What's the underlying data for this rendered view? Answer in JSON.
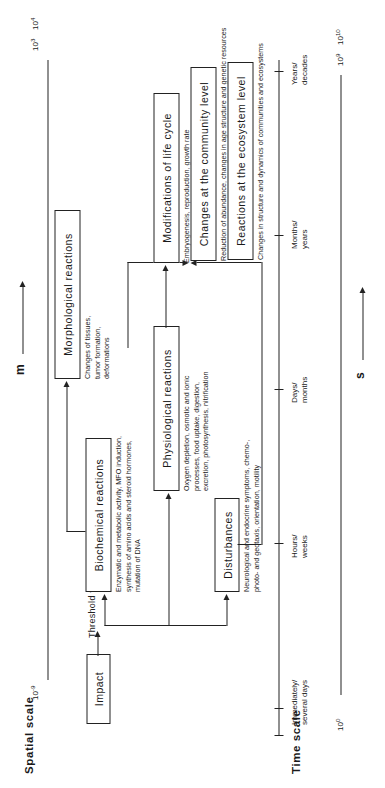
{
  "figure": {
    "spatial_scale_title": "Spatial scale",
    "time_scale_title": "Time scale"
  },
  "spatial_axis": {
    "unit": "m",
    "left_label": "10",
    "left_exp": "-9",
    "right_label_1": "10",
    "right_exp_1": "3",
    "right_label_2": "10",
    "right_exp_2": "4"
  },
  "time_axis": {
    "unit": "s",
    "left_label": "10",
    "left_exp": "0",
    "right_label_1": "10",
    "right_exp_1": "9",
    "right_label_2": "10",
    "right_exp_2": "10",
    "ticks": [
      "Immediately/\nseveral days",
      "Hours/\nweeks",
      "Days/\nmonths",
      "Months/\nyears",
      "Years/\ndecades"
    ]
  },
  "nodes": {
    "impact": {
      "label": "Impact",
      "caption": ""
    },
    "threshold": {
      "label": "Threshold value"
    },
    "biochemical": {
      "label": "Biochemical   reactions",
      "caption": "Enzymatic and metabolic activity, MFO induction,\nsynthesis of amino acids and steroid hormones,\nmutation of DNA"
    },
    "morphological": {
      "label": "Morphological   reactions",
      "caption": "Changes of tissues,\ntumor formation,\ndeformations"
    },
    "physiological": {
      "label": "Physiological   reactions",
      "caption": "Oxygen depletion, osmotic and ionic\nprocesses, food uptake, digestion,\nexcretion, photosynthesis, nitrification"
    },
    "disturbances": {
      "label": "Disturbances",
      "caption": "Neurological and endocrine symptoms, chemo-,\nphoto- and geotaxis, orientation, motility"
    },
    "life_cycle": {
      "label": "Modifications of life cycle",
      "caption": "Embryogenesis, reproduction, growth rate"
    },
    "community": {
      "label": "Changes at the community  level",
      "caption": "Reduction of abundance, changes in age structure and genetic resources"
    },
    "ecosystem": {
      "label": "Reactions at the ecosystem  level",
      "caption": "Changes in structure and dynamics of communities and ecosystems"
    }
  }
}
